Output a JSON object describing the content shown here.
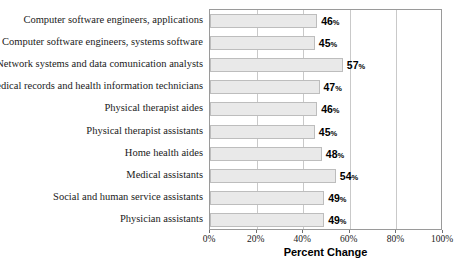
{
  "chart_data": {
    "type": "bar",
    "orientation": "horizontal",
    "title": "",
    "xlabel": "Percent Change",
    "ylabel": "",
    "xlim": [
      0,
      100
    ],
    "xticks": [
      "0%",
      "20%",
      "40%",
      "60%",
      "80%",
      "100%"
    ],
    "xtick_values": [
      0,
      20,
      40,
      60,
      80,
      100
    ],
    "grid": true,
    "legend": "none",
    "value_suffix": "%",
    "categories": [
      "Computer software engineers, applications",
      "Computer software engineers, systems software",
      "Network systems and data comunication analysts",
      "Medical records and health information technicians",
      "Physical therapist aides",
      "Physical therapist assistants",
      "Home health aides",
      "Medical assistants",
      "Social and human service assistants",
      "Physician assistants"
    ],
    "values": [
      46,
      45,
      57,
      47,
      46,
      45,
      48,
      54,
      49,
      49
    ],
    "value_labels": [
      "46",
      "45",
      "57",
      "47",
      "46",
      "45",
      "48",
      "54",
      "49",
      "49"
    ],
    "colors": {
      "bar_fill": "#e9e9e9",
      "bar_border": "#bdbdbd",
      "grid": "#c9c9c9",
      "frame": "#9a9a9a",
      "text": "#1a1a1a"
    }
  }
}
